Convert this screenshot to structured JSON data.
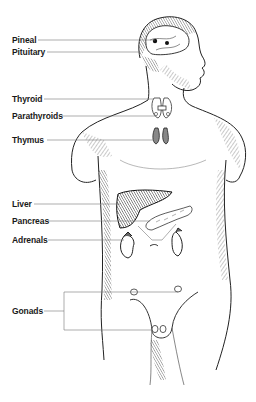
{
  "diagram": {
    "colors": {
      "ink": "#1a1a1a",
      "leader": "#777777",
      "background": "#ffffff"
    },
    "labels": [
      {
        "id": "pineal",
        "text": "Pineal",
        "y": 35
      },
      {
        "id": "pituitary",
        "text": "Pituitary",
        "y": 47
      },
      {
        "id": "thyroid",
        "text": "Thyroid",
        "y": 94
      },
      {
        "id": "parathyroids",
        "text": "Parathyroids",
        "y": 111
      },
      {
        "id": "thymus",
        "text": "Thymus",
        "y": 135
      },
      {
        "id": "liver",
        "text": "Liver",
        "y": 199
      },
      {
        "id": "pancreas",
        "text": "Pancreas",
        "y": 216
      },
      {
        "id": "adrenals",
        "text": "Adrenals",
        "y": 235
      },
      {
        "id": "gonads",
        "text": "Gonads",
        "y": 306
      }
    ]
  }
}
